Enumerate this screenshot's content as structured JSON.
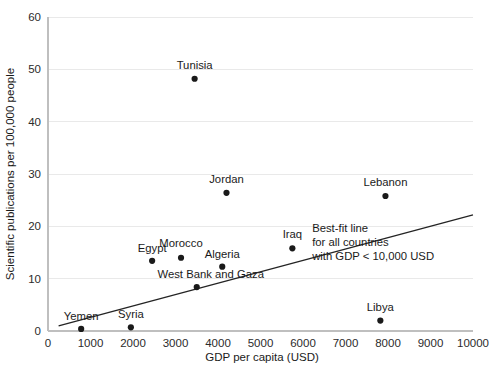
{
  "chart_data": {
    "type": "scatter",
    "title": "",
    "xlabel": "GDP per capita (USD)",
    "ylabel": "Scientific publications per 100,000 people",
    "xlim": [
      0,
      10000
    ],
    "ylim": [
      0,
      60
    ],
    "xticks": [
      0,
      1000,
      2000,
      3000,
      4000,
      5000,
      6000,
      7000,
      8000,
      9000,
      10000
    ],
    "xtick_labels": [
      "0",
      "1000",
      "2000",
      "3000",
      "4000",
      "5000",
      "6000",
      "7000",
      "8000",
      "9000",
      "10000"
    ],
    "yticks": [
      0,
      10,
      20,
      30,
      40,
      50,
      60
    ],
    "ytick_labels": [
      "0",
      "10",
      "20",
      "30",
      "40",
      "50",
      "60"
    ],
    "grid": "horizontal",
    "legend": "none",
    "marker_color": "#1a1a1a",
    "gridline_color": "#e9e9e9",
    "axis_color": "#bfbfbf",
    "fit_line_color": "#242424",
    "points": [
      {
        "label": "Yemen",
        "x": 780,
        "y": 0.4,
        "label_dx": 0,
        "label_dy": -9
      },
      {
        "label": "Syria",
        "x": 1950,
        "y": 0.7,
        "label_dx": 0,
        "label_dy": -9
      },
      {
        "label": "Egypt",
        "x": 2450,
        "y": 13.4,
        "label_dx": 0,
        "label_dy": -9
      },
      {
        "label": "Morocco",
        "x": 3130,
        "y": 14.0,
        "label_dx": 0,
        "label_dy": -11
      },
      {
        "label": "Tunisia",
        "x": 3450,
        "y": 48.2,
        "label_dx": 0,
        "label_dy": -10
      },
      {
        "label": "West Bank and Gaza",
        "x": 3500,
        "y": 8.4,
        "label_dx": 14,
        "label_dy": -9
      },
      {
        "label": "Algeria",
        "x": 4100,
        "y": 12.3,
        "label_dx": 0,
        "label_dy": -9
      },
      {
        "label": "Jordan",
        "x": 4200,
        "y": 26.4,
        "label_dx": 0,
        "label_dy": -10
      },
      {
        "label": "Iraq",
        "x": 5750,
        "y": 15.8,
        "label_dx": 0,
        "label_dy": -10
      },
      {
        "label": "Libya",
        "x": 7820,
        "y": 2.0,
        "label_dx": 0,
        "label_dy": -10
      },
      {
        "label": "Lebanon",
        "x": 7940,
        "y": 25.8,
        "label_dx": 0,
        "label_dy": -10
      }
    ],
    "fit_line": {
      "x1": 250,
      "y1": 1.0,
      "x2": 10000,
      "y2": 22.2
    },
    "annotation": {
      "lines": [
        "Best-fit line",
        "for all countries",
        "with GDP < 10,000 USD"
      ],
      "x": 8050,
      "y": 19.0
    }
  }
}
